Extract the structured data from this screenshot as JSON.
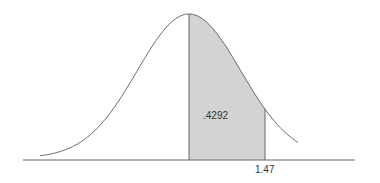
{
  "chart_data": {
    "type": "area",
    "title": "",
    "xlabel": "",
    "ylabel": "",
    "curve": "standard normal density",
    "shaded_region": {
      "from_z": 0,
      "to_z": 1.47,
      "area": 0.4292
    },
    "annotations": [
      {
        "text": ".4292",
        "position": "inside shaded region"
      },
      {
        "text": "1.47",
        "position": "below axis at right edge of shading"
      }
    ],
    "x_range": [
      -3.5,
      3.5
    ],
    "colors": {
      "shade": "#d3d3d3",
      "line": "#555555"
    }
  },
  "labels": {
    "area": ".4292",
    "z": "1.47"
  }
}
